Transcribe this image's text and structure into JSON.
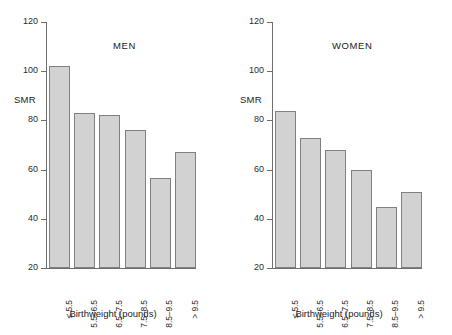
{
  "chart_data": [
    {
      "type": "bar",
      "title": "MEN",
      "xlabel": "Birthweight (pounds)",
      "ylabel": "SMR",
      "categories": [
        "≤ 5.5",
        "5.5–6.5",
        "6.5–7.5",
        "7.5–8.5",
        "8.5–9.5",
        "> 9.5"
      ],
      "values": [
        102,
        83,
        82,
        76,
        56.5,
        67
      ],
      "ylim": [
        20,
        120
      ],
      "yticks": [
        20,
        40,
        60,
        80,
        100,
        120
      ],
      "grid": false,
      "legend": "none",
      "bar_fill": "#d2d2d2",
      "bar_stroke": "#808080"
    },
    {
      "type": "bar",
      "title": "WOMEN",
      "xlabel": "Birthweight (pounds)",
      "ylabel": "SMR",
      "categories": [
        "≤ 5.5",
        "5.5–6.5",
        "6.5–7.5",
        "7.5–8.5",
        "8.5–9.5",
        "> 9.5"
      ],
      "values": [
        84,
        73,
        68,
        60,
        45,
        51
      ],
      "ylim": [
        20,
        120
      ],
      "yticks": [
        20,
        40,
        60,
        80,
        100,
        120
      ],
      "grid": false,
      "legend": "none",
      "bar_fill": "#d2d2d2",
      "bar_stroke": "#808080"
    }
  ]
}
